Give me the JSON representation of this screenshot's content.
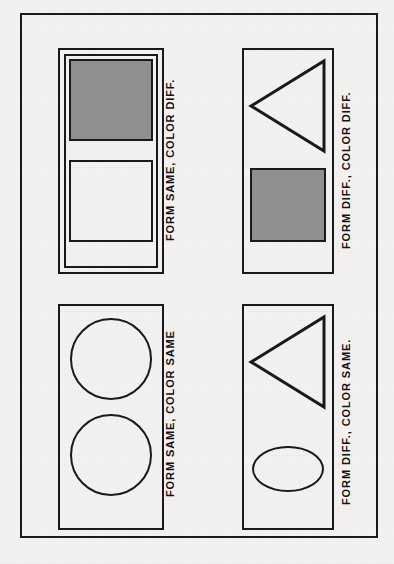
{
  "figure": {
    "background_color": "#f3f1ef",
    "ink_color": "#1a1a1a",
    "fill_gray": "#8f8f8f",
    "orientation": "landscape figure printed sideways; captions rotated 90 degrees counter-clockwise"
  },
  "panels": [
    {
      "id": "form-same-color-diff",
      "caption": "FORM SAME, COLOR DIFF.",
      "position": "top-left",
      "frame_style": "double-rule",
      "shapes": [
        {
          "name": "square",
          "fill": "gray",
          "fill_color": "#8f8f8f",
          "position": "top"
        },
        {
          "name": "square",
          "fill": "none",
          "fill_color": "#ffffff",
          "position": "bottom"
        }
      ]
    },
    {
      "id": "form-diff-color-diff",
      "caption": "FORM DIFF., COLOR DIFF.",
      "position": "top-right",
      "frame_style": "single-rule",
      "shapes": [
        {
          "name": "triangle",
          "fill": "none",
          "fill_color": "#ffffff",
          "position": "top",
          "points_toward": "left"
        },
        {
          "name": "square",
          "fill": "gray",
          "fill_color": "#8f8f8f",
          "position": "bottom"
        }
      ]
    },
    {
      "id": "form-same-color-same",
      "caption": "FORM SAME, COLOR SAME",
      "position": "bottom-left",
      "frame_style": "single-rule",
      "shapes": [
        {
          "name": "circle",
          "fill": "none",
          "fill_color": "#ffffff",
          "position": "top"
        },
        {
          "name": "circle",
          "fill": "none",
          "fill_color": "#ffffff",
          "position": "bottom"
        }
      ]
    },
    {
      "id": "form-diff-color-same",
      "caption": "FORM DIFF., COLOR SAME.",
      "position": "bottom-right",
      "frame_style": "single-rule",
      "shapes": [
        {
          "name": "triangle",
          "fill": "none",
          "fill_color": "#ffffff",
          "position": "top",
          "points_toward": "left"
        },
        {
          "name": "ellipse",
          "fill": "none",
          "fill_color": "#ffffff",
          "position": "bottom"
        }
      ]
    }
  ]
}
